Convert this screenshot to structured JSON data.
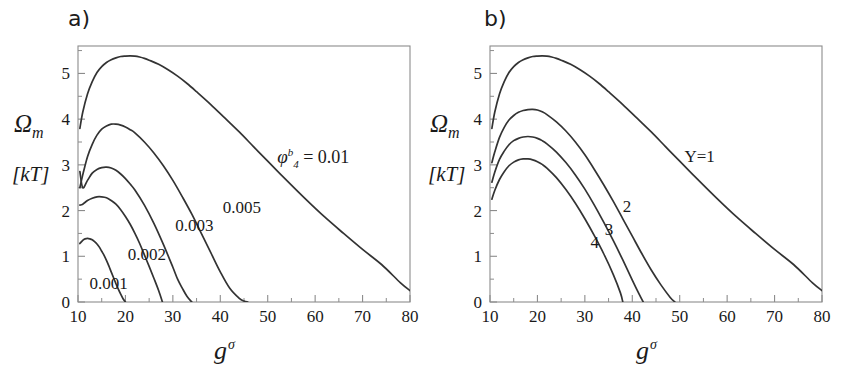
{
  "figure": {
    "background": "#ffffff",
    "curve_color": "#333333",
    "axis_color": "#8c8c8c"
  },
  "panels": [
    {
      "id": "a",
      "label": "a)",
      "ylabel_symbol": "Ω",
      "ylabel_sub": "m",
      "ylabel_units": "[kT]",
      "xlabel_symbol": "g",
      "xlabel_sup": "σ"
    },
    {
      "id": "b",
      "label": "b)",
      "ylabel_symbol": "Ω",
      "ylabel_sub": "m",
      "ylabel_units": "[kT]",
      "xlabel_symbol": "g",
      "xlabel_sup": "σ"
    }
  ],
  "chart_data": [
    {
      "type": "line",
      "panel": "a",
      "title": "a)",
      "xlabel": "g^σ",
      "ylabel": "Ω_m [kT]",
      "xlim": [
        10,
        80
      ],
      "ylim": [
        0,
        5.6
      ],
      "xticks": [
        10,
        20,
        30,
        40,
        50,
        60,
        70,
        80
      ],
      "xticklabels": [
        "10",
        "20",
        "30",
        "40",
        "50",
        "60",
        "70",
        "80"
      ],
      "yticks": [
        0,
        1,
        2,
        3,
        4,
        5
      ],
      "yticklabels": [
        "0",
        "1",
        "2",
        "3",
        "4",
        "5"
      ],
      "minor_xticks": [
        15,
        25,
        35,
        45,
        55,
        65,
        75
      ],
      "minor_yticks": [
        0.5,
        1.5,
        2.5,
        3.5,
        4.5,
        5.5
      ],
      "grid": false,
      "legend": "inline-labels",
      "legend_position": "inline",
      "series": [
        {
          "name": "0.01",
          "label": "φᵇ₄ = 0.01",
          "label_parts": {
            "symbol": "φ",
            "sup": "b",
            "sub": "4",
            "eq": "= 0.01"
          },
          "label_x": 52,
          "label_y": 3.05,
          "x": [
            10.4,
            11,
            12,
            13,
            14,
            15,
            16,
            17,
            18,
            19,
            20,
            21,
            22,
            23,
            24,
            25,
            27,
            29,
            31,
            33,
            35,
            38,
            41,
            44,
            47,
            50,
            54,
            58,
            62,
            66,
            70,
            74,
            78,
            80
          ],
          "y": [
            3.8,
            4.15,
            4.55,
            4.82,
            5.02,
            5.15,
            5.24,
            5.3,
            5.34,
            5.37,
            5.38,
            5.385,
            5.38,
            5.36,
            5.33,
            5.29,
            5.2,
            5.08,
            4.94,
            4.78,
            4.6,
            4.32,
            4.02,
            3.72,
            3.4,
            3.08,
            2.66,
            2.25,
            1.86,
            1.5,
            1.15,
            0.82,
            0.42,
            0.25
          ]
        },
        {
          "name": "0.005",
          "label": "0.005",
          "label_x": 40.5,
          "label_y": 1.95,
          "x": [
            10.4,
            11,
            12,
            13,
            14,
            15,
            16,
            17,
            18,
            19,
            20,
            21,
            22,
            24,
            26,
            28,
            30,
            32,
            34,
            36,
            38,
            40,
            42,
            44,
            45,
            45.8
          ],
          "y": [
            2.5,
            2.78,
            3.18,
            3.45,
            3.65,
            3.78,
            3.85,
            3.89,
            3.89,
            3.87,
            3.83,
            3.77,
            3.7,
            3.5,
            3.26,
            2.98,
            2.66,
            2.3,
            1.92,
            1.5,
            1.08,
            0.66,
            0.3,
            0.08,
            0.02,
            0.0
          ]
        },
        {
          "name": "0.003",
          "label": "0.003",
          "label_x": 30.5,
          "label_y": 1.55,
          "x": [
            10.4,
            11,
            12,
            13,
            14,
            15,
            16,
            17,
            18,
            19,
            20,
            21,
            22,
            24,
            26,
            28,
            30,
            31,
            32,
            33,
            34
          ],
          "y": [
            2.85,
            2.5,
            2.66,
            2.82,
            2.9,
            2.94,
            2.95,
            2.93,
            2.88,
            2.8,
            2.7,
            2.58,
            2.45,
            2.12,
            1.72,
            1.26,
            0.76,
            0.5,
            0.3,
            0.12,
            0.0
          ]
        },
        {
          "name": "0.002",
          "label": "0.002",
          "label_x": 20.5,
          "label_y": 0.92,
          "x": [
            10.4,
            11,
            12,
            13,
            14,
            15,
            16,
            17,
            18,
            19,
            20,
            21,
            22,
            23,
            24,
            25,
            26,
            27,
            27.8
          ],
          "y": [
            2.12,
            2.14,
            2.22,
            2.27,
            2.3,
            2.3,
            2.28,
            2.22,
            2.14,
            2.02,
            1.87,
            1.7,
            1.5,
            1.28,
            1.03,
            0.78,
            0.52,
            0.25,
            0.0
          ]
        },
        {
          "name": "0.001",
          "label": "0.001",
          "label_x": 12.4,
          "label_y": 0.28,
          "x": [
            10.4,
            11,
            11.5,
            12,
            12.5,
            13,
            13.5,
            14,
            14.5,
            15,
            15.5,
            16,
            16.5,
            17,
            17.5,
            18,
            18.5,
            19,
            19.5,
            20
          ],
          "y": [
            1.28,
            1.35,
            1.38,
            1.39,
            1.38,
            1.36,
            1.32,
            1.27,
            1.2,
            1.11,
            1.02,
            0.91,
            0.79,
            0.66,
            0.53,
            0.4,
            0.28,
            0.17,
            0.07,
            0.0
          ]
        }
      ]
    },
    {
      "type": "line",
      "panel": "b",
      "title": "b)",
      "xlabel": "g^σ",
      "ylabel": "Ω_m [kT]",
      "xlim": [
        10,
        80
      ],
      "ylim": [
        0,
        5.6
      ],
      "xticks": [
        10,
        20,
        30,
        40,
        50,
        60,
        70,
        80
      ],
      "xticklabels": [
        "10",
        "20",
        "30",
        "40",
        "50",
        "60",
        "70",
        "80"
      ],
      "yticks": [
        0,
        1,
        2,
        3,
        4,
        5
      ],
      "yticklabels": [
        "0",
        "1",
        "2",
        "3",
        "4",
        "5"
      ],
      "minor_xticks": [
        15,
        25,
        35,
        45,
        55,
        65,
        75
      ],
      "minor_yticks": [
        0.5,
        1.5,
        2.5,
        3.5,
        4.5,
        5.5
      ],
      "grid": false,
      "legend": "inline-labels",
      "legend_position": "inline",
      "series": [
        {
          "name": "Y=1",
          "label": "Y=1",
          "label_x": 51,
          "label_y": 3.06,
          "x": [
            10.4,
            11,
            12,
            13,
            14,
            15,
            16,
            17,
            18,
            19,
            20,
            21,
            22,
            23,
            24,
            25,
            27,
            29,
            31,
            33,
            35,
            38,
            41,
            44,
            47,
            50,
            54,
            58,
            62,
            66,
            70,
            74,
            78,
            80
          ],
          "y": [
            3.8,
            4.15,
            4.55,
            4.82,
            5.02,
            5.15,
            5.24,
            5.3,
            5.34,
            5.37,
            5.38,
            5.385,
            5.38,
            5.36,
            5.33,
            5.29,
            5.2,
            5.08,
            4.94,
            4.78,
            4.6,
            4.32,
            4.02,
            3.72,
            3.4,
            3.08,
            2.66,
            2.25,
            1.86,
            1.5,
            1.15,
            0.82,
            0.42,
            0.25
          ]
        },
        {
          "name": "2",
          "label": "2",
          "label_x": 38,
          "label_y": 1.96,
          "x": [
            10.4,
            11,
            12,
            13,
            14,
            15,
            16,
            17,
            18,
            19,
            20,
            21,
            22,
            24,
            26,
            28,
            30,
            32,
            34,
            36,
            38,
            40,
            42,
            44,
            46,
            48,
            49
          ],
          "y": [
            3.05,
            3.28,
            3.6,
            3.82,
            3.98,
            4.08,
            4.15,
            4.19,
            4.21,
            4.215,
            4.2,
            4.16,
            4.1,
            3.94,
            3.74,
            3.5,
            3.22,
            2.9,
            2.56,
            2.2,
            1.82,
            1.44,
            1.06,
            0.7,
            0.38,
            0.1,
            0.0
          ]
        },
        {
          "name": "3",
          "label": "3",
          "label_x": 34.2,
          "label_y": 1.46,
          "x": [
            10.4,
            11,
            12,
            13,
            14,
            15,
            16,
            17,
            18,
            19,
            20,
            21,
            22,
            24,
            26,
            28,
            30,
            32,
            34,
            36,
            38,
            40,
            41.5,
            42.3
          ],
          "y": [
            2.62,
            2.84,
            3.12,
            3.3,
            3.44,
            3.53,
            3.58,
            3.61,
            3.62,
            3.61,
            3.58,
            3.53,
            3.46,
            3.28,
            3.05,
            2.78,
            2.47,
            2.12,
            1.74,
            1.34,
            0.92,
            0.48,
            0.16,
            0.0
          ]
        },
        {
          "name": "4",
          "label": "4",
          "label_x": 31.2,
          "label_y": 1.18,
          "x": [
            10.4,
            11,
            12,
            13,
            14,
            15,
            16,
            17,
            18,
            19,
            20,
            21,
            22,
            24,
            26,
            28,
            30,
            32,
            34,
            36,
            37.5,
            38
          ],
          "y": [
            2.25,
            2.44,
            2.68,
            2.85,
            2.98,
            3.06,
            3.11,
            3.13,
            3.13,
            3.11,
            3.07,
            3.01,
            2.93,
            2.72,
            2.46,
            2.16,
            1.82,
            1.45,
            1.05,
            0.6,
            0.2,
            0.0
          ]
        }
      ]
    }
  ]
}
